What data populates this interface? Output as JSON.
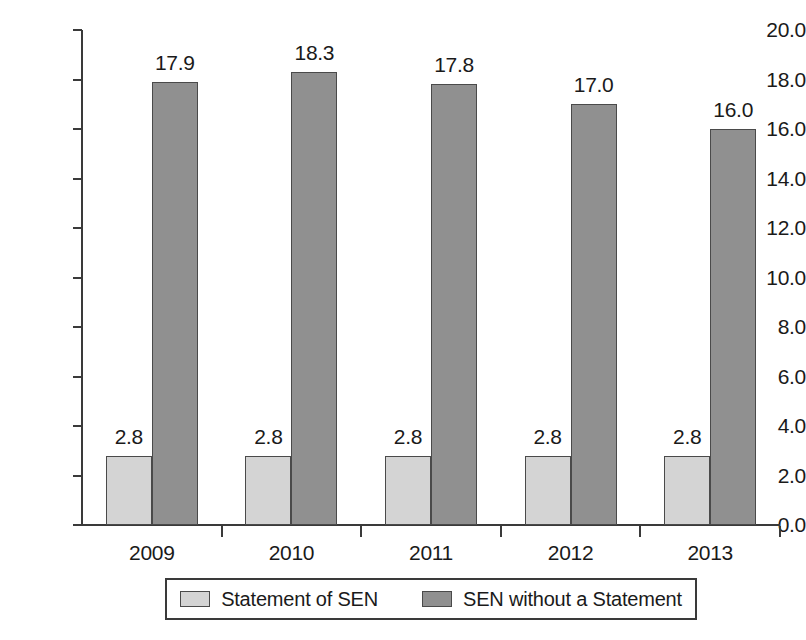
{
  "chart_data": {
    "type": "bar",
    "title": "",
    "subtitle": "",
    "xlabel": "",
    "ylabel": "",
    "categories": [
      "2009",
      "2010",
      "2011",
      "2012",
      "2013"
    ],
    "series": [
      {
        "name": "Statement of SEN",
        "color": "#d4d4d4",
        "values": [
          2.8,
          2.8,
          2.8,
          2.8,
          2.8
        ],
        "labels": [
          "2.8",
          "2.8",
          "2.8",
          "2.8",
          "2.8"
        ]
      },
      {
        "name": "SEN without a Statement",
        "color": "#909090",
        "values": [
          17.9,
          18.3,
          17.8,
          17.0,
          16.0
        ],
        "labels": [
          "17.9",
          "18.3",
          "17.8",
          "17.0",
          "16.0"
        ]
      }
    ],
    "ylim": [
      0,
      20
    ],
    "ytick_step": 2,
    "ytick_labels": [
      "0.0",
      "2.0",
      "4.0",
      "6.0",
      "8.0",
      "10.0",
      "12.0",
      "14.0",
      "16.0",
      "18.0",
      "20.0"
    ],
    "ytick_values": [
      0,
      2,
      4,
      6,
      8,
      10,
      12,
      14,
      16,
      18,
      20
    ],
    "grid": false,
    "legend_position": "bottom",
    "data_labels_shown": true
  },
  "legend": {
    "entries": [
      {
        "label": "Statement of SEN",
        "color": "#d4d4d4"
      },
      {
        "label": "SEN without a Statement",
        "color": "#909090"
      }
    ]
  },
  "axis": {
    "line_color": "#3a3a3a"
  }
}
